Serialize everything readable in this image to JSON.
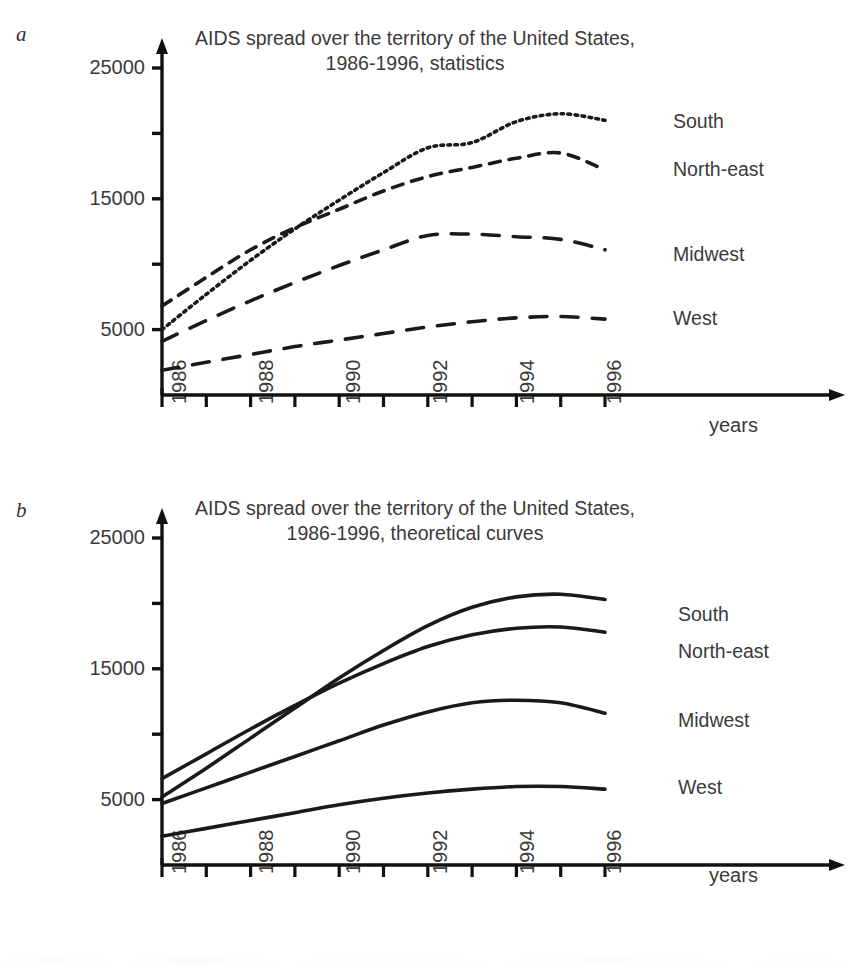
{
  "figure": {
    "panels": [
      {
        "letter": "a",
        "title_line1": "AIDS spread over the territory of the United States,",
        "title_line2": "1986-1996, statistics",
        "xaxis_name": "years",
        "y_tick_labels": [
          "25000",
          "15000",
          "5000"
        ],
        "x_tick_labels": [
          "1986",
          "1988",
          "1990",
          "1992",
          "1994",
          "1996"
        ],
        "series_labels": [
          "South",
          "North-east",
          "Midwest",
          "West"
        ]
      },
      {
        "letter": "b",
        "title_line1": "AIDS spread over the territory of the United States,",
        "title_line2": "1986-1996, theoretical curves",
        "xaxis_name": "years",
        "y_tick_labels": [
          "25000",
          "15000",
          "5000"
        ],
        "x_tick_labels": [
          "1986",
          "1988",
          "1990",
          "1992",
          "1994",
          "1996"
        ],
        "series_labels": [
          "South",
          "North-east",
          "Midwest",
          "West"
        ]
      }
    ]
  },
  "chart_data": [
    {
      "id": "panel-a",
      "type": "line",
      "title": "AIDS spread over the territory of the United States, 1986-1996, statistics",
      "subtitle": "statistics",
      "xlabel": "years",
      "ylabel": "",
      "xlim": [
        1986,
        1996
      ],
      "ylim": [
        0,
        25000
      ],
      "ytick_values": [
        0,
        5000,
        10000,
        15000,
        20000,
        25000
      ],
      "ytick_labeled": [
        5000,
        15000,
        25000
      ],
      "xtick_values": [
        1986,
        1987,
        1988,
        1989,
        1990,
        1991,
        1992,
        1993,
        1994,
        1995,
        1996
      ],
      "xtick_labeled": [
        1986,
        1988,
        1990,
        1992,
        1994,
        1996
      ],
      "grid": false,
      "legend_position": "right-of-curve-ends",
      "x": [
        1986,
        1987,
        1988,
        1989,
        1990,
        1991,
        1992,
        1993,
        1994,
        1995,
        1996
      ],
      "series": [
        {
          "name": "South",
          "linestyle": "dotted",
          "color": "#1a1a1a",
          "values": [
            5000,
            7700,
            10300,
            12700,
            14900,
            17000,
            18900,
            19300,
            20900,
            21500,
            21000
          ]
        },
        {
          "name": "North-east",
          "linestyle": "dashed",
          "color": "#1a1a1a",
          "values": [
            6800,
            9000,
            11100,
            12800,
            14200,
            15600,
            16700,
            17400,
            18100,
            18500,
            17200
          ]
        },
        {
          "name": "Midwest",
          "linestyle": "long-dashed",
          "color": "#1a1a1a",
          "values": [
            4100,
            5700,
            7200,
            8600,
            9900,
            11100,
            12200,
            12300,
            12100,
            11900,
            11100
          ]
        },
        {
          "name": "West",
          "linestyle": "long-dashed",
          "color": "#1a1a1a",
          "values": [
            1900,
            2500,
            3100,
            3700,
            4200,
            4700,
            5200,
            5600,
            5900,
            6000,
            5800
          ]
        }
      ]
    },
    {
      "id": "panel-b",
      "type": "line",
      "title": "AIDS spread over the territory of the United States, 1986-1996, theoretical curves",
      "subtitle": "theoretical curves",
      "xlabel": "years",
      "ylabel": "",
      "xlim": [
        1986,
        1996
      ],
      "ylim": [
        0,
        25000
      ],
      "ytick_values": [
        0,
        5000,
        10000,
        15000,
        20000,
        25000
      ],
      "ytick_labeled": [
        5000,
        15000,
        25000
      ],
      "xtick_values": [
        1986,
        1987,
        1988,
        1989,
        1990,
        1991,
        1992,
        1993,
        1994,
        1995,
        1996
      ],
      "xtick_labeled": [
        1986,
        1988,
        1990,
        1992,
        1994,
        1996
      ],
      "grid": false,
      "legend_position": "right-of-curve-ends",
      "x": [
        1986,
        1987,
        1988,
        1989,
        1990,
        1991,
        1992,
        1993,
        1994,
        1995,
        1996
      ],
      "series": [
        {
          "name": "South",
          "linestyle": "solid",
          "color": "#1a1a1a",
          "values": [
            5200,
            7400,
            9700,
            12000,
            14300,
            16400,
            18300,
            19700,
            20500,
            20700,
            20300
          ]
        },
        {
          "name": "North-east",
          "linestyle": "solid",
          "color": "#1a1a1a",
          "values": [
            6600,
            8500,
            10400,
            12200,
            13900,
            15400,
            16700,
            17600,
            18100,
            18200,
            17800
          ]
        },
        {
          "name": "Midwest",
          "linestyle": "solid",
          "color": "#1a1a1a",
          "values": [
            4700,
            5900,
            7100,
            8300,
            9500,
            10700,
            11700,
            12400,
            12600,
            12400,
            11600
          ]
        },
        {
          "name": "West",
          "linestyle": "solid",
          "color": "#1a1a1a",
          "values": [
            2200,
            2800,
            3400,
            4000,
            4600,
            5100,
            5500,
            5800,
            6000,
            6000,
            5800
          ]
        }
      ]
    }
  ]
}
